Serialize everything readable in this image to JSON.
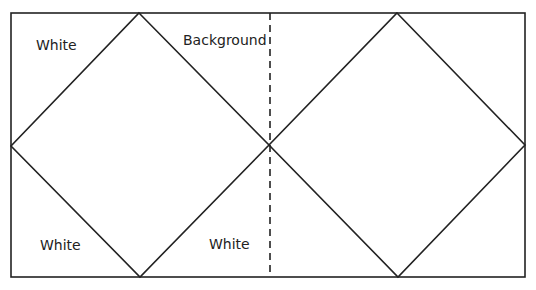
{
  "diagram": {
    "labels": {
      "top_left": "White",
      "top_center": "Background",
      "bottom_left": "White",
      "bottom_center": "White"
    },
    "colors": {
      "stroke": "#222222",
      "background": "#ffffff"
    },
    "shapes": {
      "frame": {
        "x1": 11,
        "y1": 13,
        "x2": 525,
        "y2": 277
      },
      "left_diamond": {
        "top": [
          139,
          13
        ],
        "right": [
          269,
          145
        ],
        "bottom": [
          140,
          277
        ],
        "left": [
          11,
          146
        ]
      },
      "right_diamond": {
        "top": [
          397,
          13
        ],
        "right": [
          525,
          145
        ],
        "bottom": [
          398,
          277
        ],
        "left": [
          269,
          145
        ]
      },
      "fold_line": {
        "x": 270,
        "y1": 13,
        "y2": 277,
        "style": "dashed"
      }
    }
  }
}
